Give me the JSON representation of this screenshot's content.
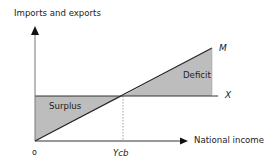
{
  "diagram": {
    "y_axis_label": "Imports and exports",
    "x_axis_label": "National income",
    "origin_label": "o",
    "x_tick_label": "Ycb",
    "lines": {
      "imports": {
        "label": "M",
        "type": "upward-sloping line from origin"
      },
      "exports": {
        "label": "X",
        "type": "horizontal line"
      }
    },
    "regions": {
      "left": {
        "label": "Surplus",
        "color": "#b8b8b8"
      },
      "right": {
        "label": "Deficit",
        "color": "#b8b8b8"
      }
    },
    "colors": {
      "axis": "#111111",
      "shade": "#bdbdbd",
      "dotted": "#888888"
    }
  }
}
